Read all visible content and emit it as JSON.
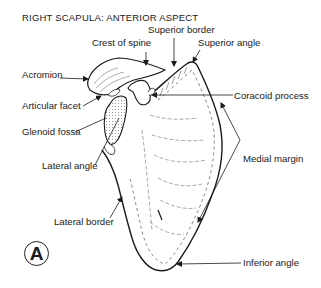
{
  "figure": {
    "title": "RIGHT SCAPULA: ANTERIOR ASPECT",
    "panel_letter": "A",
    "labels": {
      "superior_border": "Superior border",
      "crest_of_spine": "Crest of spine",
      "superior_angle": "Superior angle",
      "acromion": "Acromion",
      "articular_facet": "Articular facet",
      "coracoid_process": "Coracoid process",
      "glenoid_fossa": "Glenoid fossa",
      "lateral_angle": "Lateral angle",
      "medial_margin": "Medial margin",
      "lateral_border": "Lateral border",
      "inferior_angle": "Inferior angle"
    },
    "colors": {
      "line": "#1a1a1a",
      "background": "#ffffff"
    }
  }
}
